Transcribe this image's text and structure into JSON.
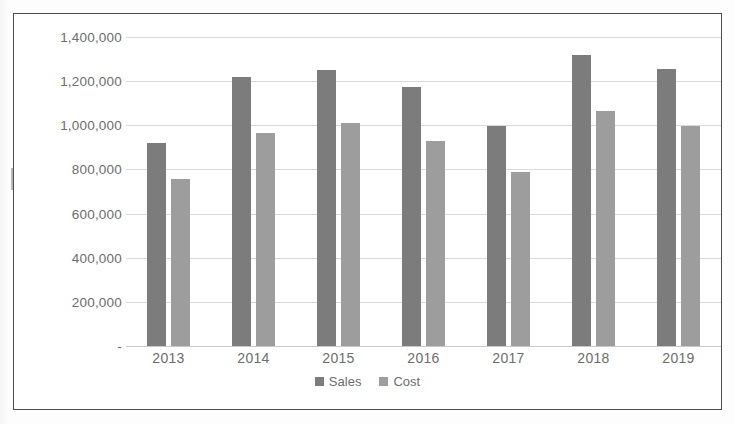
{
  "chart_data": {
    "type": "bar",
    "title": "",
    "xlabel": "",
    "ylabel": "",
    "categories": [
      "2013",
      "2014",
      "2015",
      "2016",
      "2017",
      "2018",
      "2019"
    ],
    "series": [
      {
        "name": "Sales",
        "color": "#7c7c7c",
        "values": [
          920000,
          1220000,
          1250000,
          1175000,
          995000,
          1320000,
          1255000
        ]
      },
      {
        "name": "Cost",
        "color": "#9d9d9d",
        "values": [
          755000,
          965000,
          1010000,
          930000,
          790000,
          1065000,
          995000
        ]
      }
    ],
    "ylim": [
      0,
      1400000
    ],
    "ytick_values": [
      1400000,
      1200000,
      1000000,
      800000,
      600000,
      400000,
      200000,
      0
    ],
    "ytick_labels": [
      "1,400,000",
      "1,200,000",
      "1,000,000",
      "800,000",
      "600,000",
      "400,000",
      "200,000",
      "-"
    ],
    "grid": true,
    "legend_position": "bottom"
  },
  "legend": {
    "items": [
      {
        "label": "Sales",
        "swatch": "sales-legend-swatch"
      },
      {
        "label": "Cost",
        "swatch": "cost-legend-swatch"
      }
    ]
  },
  "colors": {
    "sales": "#7c7c7c",
    "cost": "#9d9d9d",
    "gridline": "#d9d9d9",
    "axis_text": "#6d6d6d",
    "frame_border": "#4c4c4c",
    "plot_background": "#ffffff"
  }
}
